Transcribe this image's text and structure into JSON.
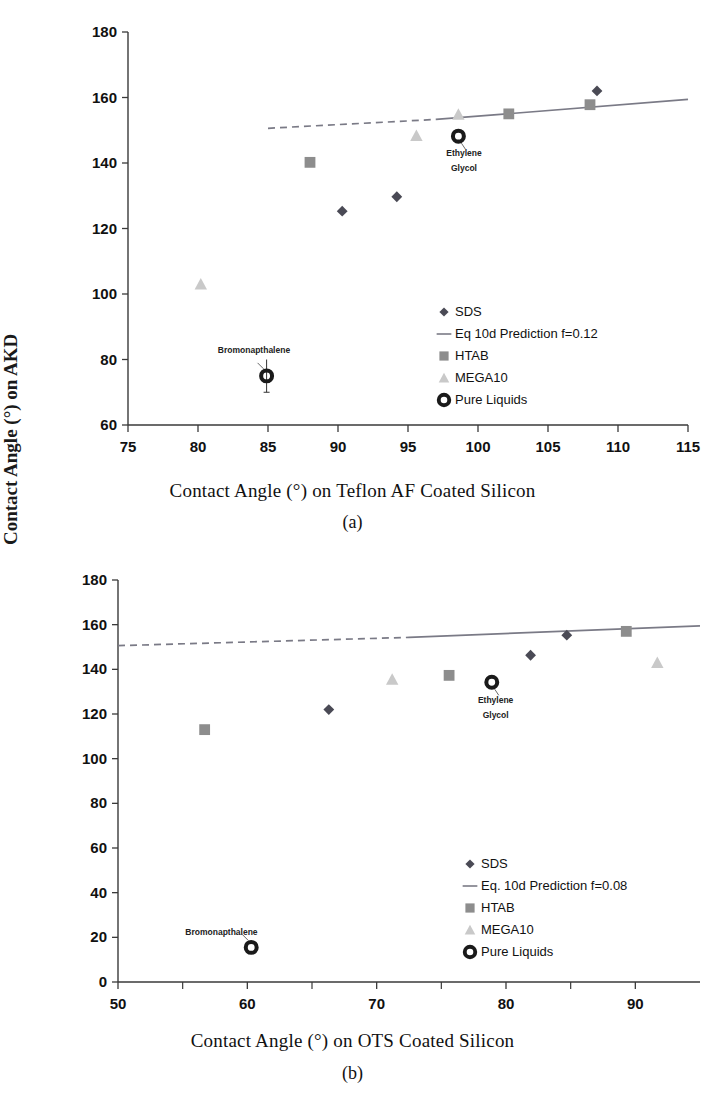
{
  "figure": {
    "panels": [
      {
        "caption": "(a)",
        "xlabel": "Contact Angle (°) on Teflon AF Coated Silicon",
        "ylabel": "Contact Angle (°) on Teflon AKD"
      },
      {
        "caption": "(b)",
        "xlabel": "Contact Angle (°) on OTS Coated Silicon",
        "ylabel": "Contact Angle (°) on AKD"
      }
    ]
  },
  "colors": {
    "sds": "#4a4a55",
    "htab": "#8d8d8d",
    "mega10": "#c9c9c9",
    "pure": "#1a1a1a",
    "prediction_line": "#7a7a86",
    "axis": "#3a3a3a"
  },
  "chart_data": [
    {
      "type": "scatter",
      "title": "",
      "subtitle": "",
      "xlabel": "Contact Angle (°) on Teflon AF Coated Silicon",
      "ylabel": "Contact Angle (°) on Teflon AKD",
      "xlim": [
        75,
        115
      ],
      "ylim": [
        60,
        180
      ],
      "xticks": [
        75,
        80,
        85,
        90,
        95,
        100,
        105,
        110,
        115
      ],
      "yticks": [
        60,
        80,
        100,
        120,
        140,
        160,
        180
      ],
      "grid": false,
      "legend_position": "lower-right",
      "series": [
        {
          "name": "SDS",
          "marker": "diamond",
          "color": "#4a4a55",
          "points": [
            {
              "x": 90.3,
              "y": 125.3
            },
            {
              "x": 94.2,
              "y": 129.7
            },
            {
              "x": 108.5,
              "y": 162.0
            }
          ]
        },
        {
          "name": "HTAB",
          "marker": "square",
          "color": "#8d8d8d",
          "points": [
            {
              "x": 88.0,
              "y": 140.2
            },
            {
              "x": 102.2,
              "y": 155.0
            },
            {
              "x": 108.0,
              "y": 157.8
            }
          ]
        },
        {
          "name": "MEGA10",
          "marker": "triangle",
          "color": "#c9c9c9",
          "points": [
            {
              "x": 80.2,
              "y": 103.0
            },
            {
              "x": 95.6,
              "y": 148.3
            },
            {
              "x": 98.6,
              "y": 154.8
            }
          ]
        },
        {
          "name": "Pure Liquids",
          "marker": "open-circle",
          "color": "#1a1a1a",
          "points": [
            {
              "x": 84.9,
              "y": 75.0,
              "label": "Bromonapthalene",
              "yerr": 5.0
            },
            {
              "x": 98.6,
              "y": 148.2,
              "label": "Ethylene Glycol"
            }
          ]
        }
      ],
      "prediction_line": {
        "name": "Eq 10d Prediction f=0.12",
        "color": "#7a7a86",
        "dashed_from": {
          "x": 85.0,
          "y": 150.6
        },
        "solid_from": {
          "x": 97.0,
          "y": 153.3
        },
        "solid_to": {
          "x": 115.0,
          "y": 159.4
        }
      },
      "annotations": [
        {
          "text": "Bromonapthalene",
          "x": 84.0,
          "y": 82.0
        },
        {
          "text": "Ethylene",
          "x": 99.0,
          "y": 142.0
        },
        {
          "text": "Glycol",
          "x": 99.0,
          "y": 137.5
        }
      ],
      "legend": [
        {
          "label": "SDS",
          "marker": "diamond",
          "color": "#4a4a55"
        },
        {
          "label": "Eq 10d Prediction f=0.12",
          "marker": "line",
          "color": "#7a7a86"
        },
        {
          "label": "HTAB",
          "marker": "square",
          "color": "#8d8d8d"
        },
        {
          "label": "MEGA10",
          "marker": "triangle",
          "color": "#c9c9c9"
        },
        {
          "label": "Pure Liquids",
          "marker": "open-circle",
          "color": "#1a1a1a"
        }
      ]
    },
    {
      "type": "scatter",
      "title": "",
      "subtitle": "",
      "xlabel": "Contact Angle (°) on OTS Coated Silicon",
      "ylabel": "Contact Angle (°) on AKD",
      "xlim": [
        50,
        95
      ],
      "ylim": [
        0,
        180
      ],
      "xticks": [
        50,
        60,
        70,
        80,
        90
      ],
      "xminorticks": [
        55,
        65,
        75,
        85
      ],
      "yticks": [
        0,
        20,
        40,
        60,
        80,
        100,
        120,
        140,
        160,
        180
      ],
      "grid": false,
      "legend_position": "lower-right",
      "series": [
        {
          "name": "SDS",
          "marker": "diamond",
          "color": "#4a4a55",
          "points": [
            {
              "x": 66.3,
              "y": 122.0
            },
            {
              "x": 81.9,
              "y": 146.3
            },
            {
              "x": 84.7,
              "y": 155.3
            }
          ]
        },
        {
          "name": "HTAB",
          "marker": "square",
          "color": "#8d8d8d",
          "points": [
            {
              "x": 56.7,
              "y": 113.0
            },
            {
              "x": 75.6,
              "y": 137.3
            },
            {
              "x": 89.3,
              "y": 157.0
            }
          ]
        },
        {
          "name": "MEGA10",
          "marker": "triangle",
          "color": "#c9c9c9",
          "points": [
            {
              "x": 71.2,
              "y": 135.5
            },
            {
              "x": 91.7,
              "y": 143.0
            }
          ]
        },
        {
          "name": "Pure Liquids",
          "marker": "open-circle",
          "color": "#1a1a1a",
          "points": [
            {
              "x": 60.3,
              "y": 15.5,
              "label": "Bromonapthalene"
            },
            {
              "x": 78.9,
              "y": 134.2,
              "label": "Ethylene Glycol"
            }
          ]
        }
      ],
      "prediction_line": {
        "name": "Eq. 10d Prediction f=0.08",
        "color": "#7a7a86",
        "dashed_from": {
          "x": 50.0,
          "y": 150.6
        },
        "solid_from": {
          "x": 72.5,
          "y": 154.3
        },
        "solid_to": {
          "x": 95.0,
          "y": 159.5
        }
      },
      "annotations": [
        {
          "text": "Bromonapthalene",
          "x": 58.0,
          "y": 21.0
        },
        {
          "text": "Ethylene",
          "x": 79.2,
          "y": 125.0
        },
        {
          "text": "Glycol",
          "x": 79.2,
          "y": 118.0
        }
      ],
      "legend": [
        {
          "label": "SDS",
          "marker": "diamond",
          "color": "#4a4a55"
        },
        {
          "label": "Eq. 10d Prediction f=0.08",
          "marker": "line",
          "color": "#7a7a86"
        },
        {
          "label": "HTAB",
          "marker": "square",
          "color": "#8d8d8d"
        },
        {
          "label": "MEGA10",
          "marker": "triangle",
          "color": "#c9c9c9"
        },
        {
          "label": "Pure Liquids",
          "marker": "open-circle",
          "color": "#1a1a1a"
        }
      ]
    }
  ]
}
